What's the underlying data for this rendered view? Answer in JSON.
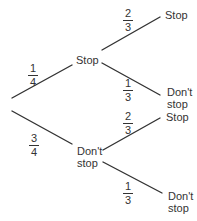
{
  "diagram": {
    "type": "probability-tree",
    "line_color": "#333333",
    "root_branches": [
      {
        "probability": {
          "num": "1",
          "den": "4"
        },
        "outcome": "Stop",
        "children": [
          {
            "probability": {
              "num": "2",
              "den": "3"
            },
            "outcome": "Stop"
          },
          {
            "probability": {
              "num": "1",
              "den": "3"
            },
            "outcome_line1": "Don't",
            "outcome_line2": "stop"
          }
        ]
      },
      {
        "probability": {
          "num": "3",
          "den": "4"
        },
        "outcome_line1": "Don't",
        "outcome_line2": "stop",
        "children": [
          {
            "probability": {
              "num": "2",
              "den": "3"
            },
            "outcome": "Stop"
          },
          {
            "probability": {
              "num": "1",
              "den": "3"
            },
            "outcome_line1": "Don't",
            "outcome_line2": "stop"
          }
        ]
      }
    ]
  }
}
